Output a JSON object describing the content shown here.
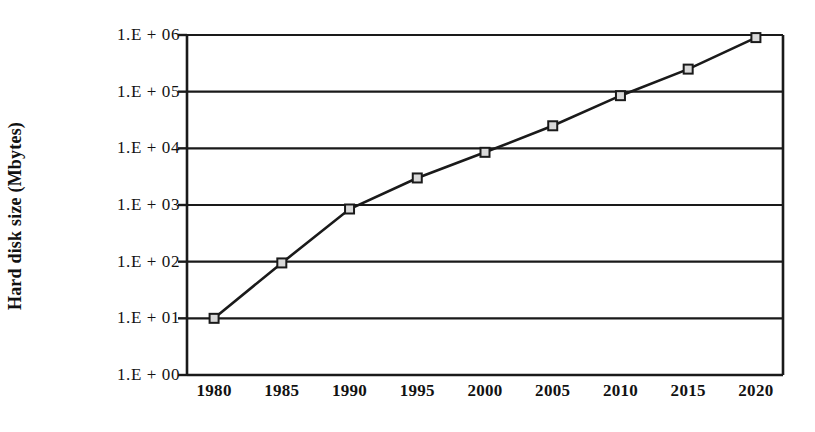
{
  "chart_data": {
    "type": "line",
    "title": "",
    "xlabel": "",
    "ylabel": "Hard disk size (Mbytes)",
    "x": [
      1980,
      1985,
      1990,
      1995,
      2000,
      2005,
      2010,
      2015,
      2020
    ],
    "x_tick_labels": [
      "1980",
      "1985",
      "1990",
      "1995",
      "2000",
      "2005",
      "2010",
      "2015",
      "2020"
    ],
    "y_tick_labels": [
      "1.E + 06",
      "1.E + 05",
      "1.E + 04",
      "1.E + 03",
      "1.E + 02",
      "1.E + 01",
      "1.E + 00"
    ],
    "y_tick_values": [
      1000000,
      100000,
      10000,
      1000,
      100,
      10,
      1
    ],
    "yscale": "log",
    "ylim": [
      1,
      1000000
    ],
    "xlim": [
      1978,
      2022
    ],
    "grid": "horizontal",
    "legend": "none",
    "series": [
      {
        "name": "Hard disk size",
        "marker": "square",
        "marker_fill": "#d9d9d9",
        "marker_edge": "#1a1a1a",
        "line_color": "#1a1a1a",
        "values": [
          10,
          95,
          850,
          3000,
          8500,
          25000,
          85000,
          250000,
          900000
        ]
      }
    ]
  },
  "colors": {
    "axis": "#1a1a1a",
    "grid": "#1a1a1a",
    "background": "#ffffff",
    "text": "#121212"
  }
}
